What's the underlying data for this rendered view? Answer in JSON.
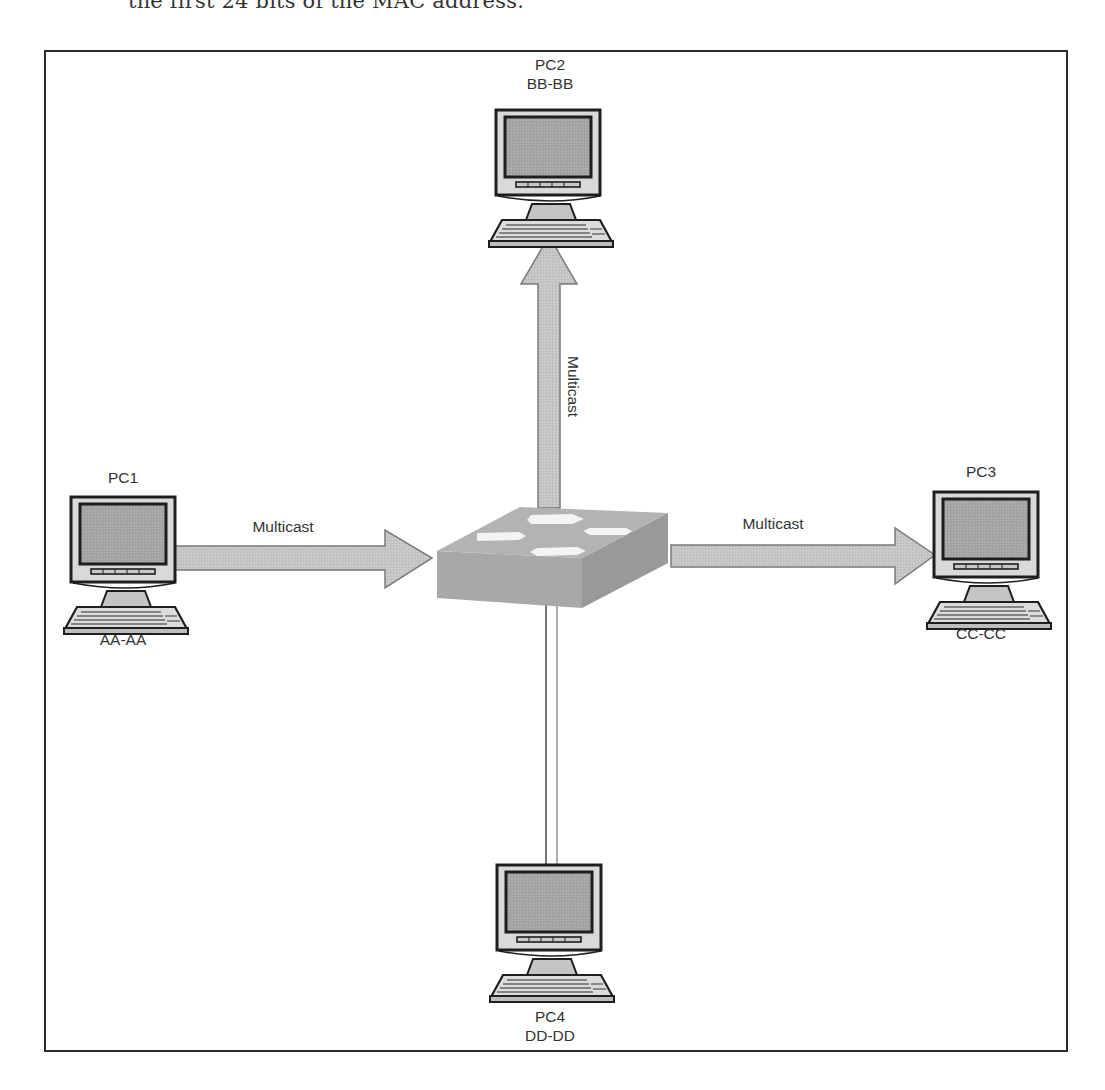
{
  "caption_fragment": "the first 24 bits of the MAC address.",
  "diagram": {
    "switch": {
      "label": "",
      "icon": "switch-icon"
    },
    "nodes": [
      {
        "id": "pc1",
        "name": "PC1",
        "mac": "AA-AA",
        "role": "sender",
        "icon": "computer-icon"
      },
      {
        "id": "pc2",
        "name": "PC2",
        "mac": "BB-BB",
        "role": "receiver",
        "icon": "computer-icon"
      },
      {
        "id": "pc3",
        "name": "PC3",
        "mac": "CC-CC",
        "role": "receiver",
        "icon": "computer-icon"
      },
      {
        "id": "pc4",
        "name": "PC4",
        "mac": "DD-DD",
        "role": "not-receiving",
        "icon": "computer-icon"
      }
    ],
    "links": [
      {
        "from": "pc1",
        "to": "switch",
        "label": "Multicast",
        "style": "arrow"
      },
      {
        "from": "switch",
        "to": "pc2",
        "label": "Multicast",
        "style": "arrow"
      },
      {
        "from": "switch",
        "to": "pc3",
        "label": "Multicast",
        "style": "arrow"
      },
      {
        "from": "switch",
        "to": "pc4",
        "label": "",
        "style": "plain-line"
      }
    ]
  },
  "colors": {
    "frame": "#2b2b2b",
    "arrow_fill": "#c9c9c9",
    "arrow_stroke": "#7d7d7d",
    "switch_top": "#b0b0b0",
    "switch_front": "#a3a3a3",
    "switch_side": "#969696",
    "screen": "#a9a9a9",
    "monitor_bezel": "#d6d6d6"
  }
}
